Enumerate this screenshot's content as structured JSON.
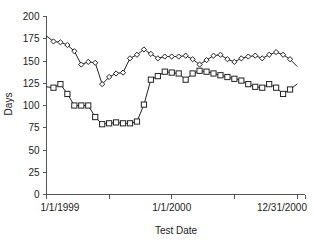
{
  "chart_data": {
    "type": "line",
    "title": "",
    "xlabel": "Test Date",
    "ylabel": "Days",
    "ylim": [
      0,
      200
    ],
    "ytick_values": [
      0,
      25,
      50,
      75,
      100,
      125,
      150,
      175,
      200
    ],
    "ytick_labels": [
      "0",
      "25",
      "50",
      "75",
      "100",
      "125",
      "150",
      "175",
      "200"
    ],
    "xlim": [
      0,
      36
    ],
    "xtick_positions": [
      0,
      9,
      18,
      27,
      36
    ],
    "xtick_labels_shown": [
      "1/1/1999",
      "1/1/2000",
      "12/31/2000"
    ],
    "xtick_label_positions": [
      0,
      18,
      36
    ],
    "grid": false,
    "legend": "none",
    "x": [
      0,
      1,
      2,
      3,
      4,
      5,
      6,
      7,
      8,
      9,
      10,
      11,
      12,
      13,
      14,
      15,
      16,
      17,
      18,
      19,
      20,
      21,
      22,
      23,
      24,
      25,
      26,
      27,
      28,
      29,
      30,
      31,
      32,
      33,
      34,
      35,
      36
    ],
    "series": [
      {
        "name": "upper-series",
        "marker": "diamond",
        "values": [
          178,
          172,
          171,
          168,
          161,
          146,
          149,
          148,
          124,
          132,
          136,
          137,
          153,
          157,
          163,
          158,
          153,
          155,
          155,
          155,
          156,
          152,
          146,
          151,
          156,
          157,
          152,
          149,
          153,
          155,
          156,
          153,
          157,
          160,
          157,
          152,
          144
        ]
      },
      {
        "name": "lower-series",
        "marker": "square",
        "values": [
          121,
          120,
          124,
          113,
          100,
          100,
          100,
          87,
          79,
          80,
          81,
          80,
          80,
          82,
          101,
          129,
          133,
          138,
          137,
          136,
          129,
          136,
          139,
          138,
          136,
          134,
          132,
          130,
          128,
          124,
          121,
          120,
          124,
          120,
          113,
          118,
          124
        ]
      }
    ]
  }
}
